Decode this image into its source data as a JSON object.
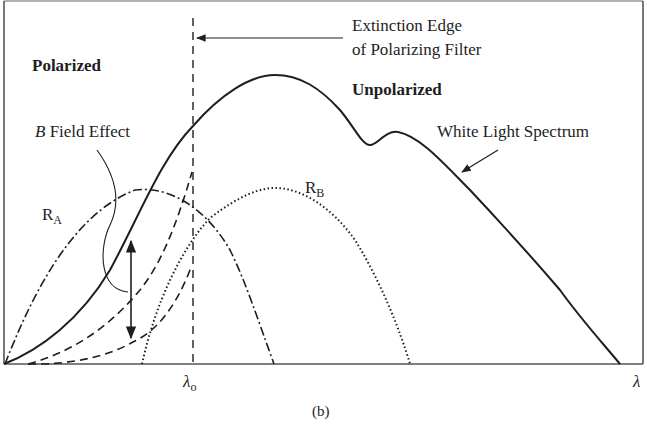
{
  "figure": {
    "caption": "(b)",
    "x_axis_label": "λ",
    "lambda0_label": "λ",
    "lambda0_sub": "o",
    "labels": {
      "polarized": "Polarized",
      "unpolarized": "Unpolarized",
      "extinction_line1": "Extinction Edge",
      "extinction_line2": "of Polarizing Filter",
      "b_field_italic": "B",
      "b_field_rest": " Field Effect",
      "white_light": "White Light Spectrum",
      "ra_main": "R",
      "ra_sub": "A",
      "rb_main": "R",
      "rb_sub": "B"
    },
    "curves": [
      {
        "name": "White Light Spectrum",
        "style": "solid"
      },
      {
        "name": "R_A",
        "style": "dash-dot"
      },
      {
        "name": "R_B",
        "style": "dotted"
      },
      {
        "name": "B-field shifted responses",
        "style": "dashed"
      },
      {
        "name": "Extinction edge λo",
        "style": "dashed-vertical"
      }
    ],
    "colors": {
      "ink": "#1e1e1e",
      "frame": "#555555",
      "background": "#ffffff"
    }
  }
}
